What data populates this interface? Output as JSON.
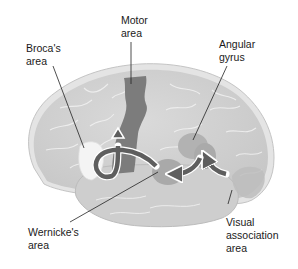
{
  "diagram": {
    "type": "anatomical-brain-lateral-view",
    "colors": {
      "background": "#ffffff",
      "cortex": "#d2d2d2",
      "cortex_rim": "#e6e6e6",
      "sulcus_lines": "#f2f2f2",
      "temporal_lobe": "#cfcfcf",
      "motor_area": "#7c7c7c",
      "broca_area": "#f4f4f4",
      "wernicke_area": "#a9a9a9",
      "angular_gyrus": "#b2b2b2",
      "visual_association_area": "#bdbdbd",
      "arrows": "#5e5e5e",
      "arrow_outline": "#ffffff",
      "leader_lines": "#222222",
      "text": "#1a1a1a"
    },
    "labels": {
      "motor": {
        "line1": "Motor",
        "line2": "area"
      },
      "broca": {
        "line1": "Broca's",
        "line2": "area"
      },
      "angular": {
        "line1": "Angular",
        "line2": "gyrus"
      },
      "wernicke": {
        "line1": "Wernicke's",
        "line2": "area"
      },
      "visual": {
        "line1": "Visual",
        "line2": "association",
        "line3": "area"
      }
    },
    "pathway": [
      "Visual association area",
      "Angular gyrus",
      "Wernicke's area",
      "Broca's area",
      "Motor area"
    ]
  }
}
